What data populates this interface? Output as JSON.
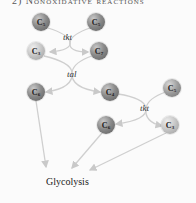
{
  "title": "2) Nonoxidative reactions",
  "nodes": [
    {
      "id": "c5a",
      "label": "C",
      "sub": "5"
    },
    {
      "id": "c5b",
      "label": "C",
      "sub": "5"
    },
    {
      "id": "c3a",
      "label": "C",
      "sub": "3"
    },
    {
      "id": "c7",
      "label": "C",
      "sub": "7"
    },
    {
      "id": "c6a",
      "label": "C",
      "sub": "6"
    },
    {
      "id": "c4",
      "label": "C",
      "sub": "4"
    },
    {
      "id": "c5c",
      "label": "C",
      "sub": "5"
    },
    {
      "id": "c6b",
      "label": "C",
      "sub": "6"
    },
    {
      "id": "c3b",
      "label": "C",
      "sub": "3"
    }
  ],
  "enzymes": {
    "tkt1": "tkt",
    "tal": "tal",
    "tkt2": "tkt"
  },
  "product": "Glycolysis",
  "colors": {
    "arrow": "#c9c9c9",
    "background": "#fbfbfb"
  }
}
